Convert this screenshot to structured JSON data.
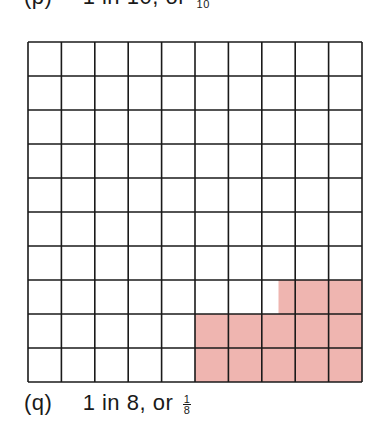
{
  "captions": {
    "top": {
      "label": "(p)",
      "text": "1 in 10, or",
      "fraction_num": "1",
      "fraction_den": "10"
    },
    "bottom": {
      "label": "(q)",
      "text": "1 in 8, or",
      "fraction_num": "1",
      "fraction_den": "8"
    }
  },
  "grid": {
    "rows": 10,
    "cols": 10,
    "line_color": "#1a1a1a",
    "fill_color": "#efb5b0",
    "shaded_regions": [
      {
        "row": 8,
        "col_start": 7.5,
        "col_end": 10
      },
      {
        "row": 9,
        "col_start": 5,
        "col_end": 10
      },
      {
        "row": 10,
        "col_start": 5,
        "col_end": 10
      }
    ],
    "shaded_fraction": "12.5 of 100 squares = 1/8"
  }
}
